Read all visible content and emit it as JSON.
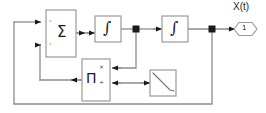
{
  "diagram": {
    "type": "block-diagram",
    "canvas": {
      "width": 266,
      "height": 113
    },
    "colors": {
      "block_stroke": "#9a9a9a",
      "block_fill": "#ffffff",
      "signal_line": "#8c8c8c",
      "arrow_fill": "#1a1a1a",
      "junction_fill": "#1a1a1a",
      "text": "#1a1a1a"
    },
    "blocks": [
      {
        "id": "sum",
        "name": "sum-block",
        "label": "Σ",
        "sign_top": "-",
        "sign_bottom": "-",
        "x": 46,
        "y": 10,
        "w": 30,
        "h": 47
      },
      {
        "id": "integrator1",
        "name": "integrator-block-1",
        "label": "∫",
        "x": 95,
        "y": 16,
        "w": 26,
        "h": 26
      },
      {
        "id": "integrator2",
        "name": "integrator-block-2",
        "label": "∫",
        "x": 162,
        "y": 16,
        "w": 26,
        "h": 26
      },
      {
        "id": "product",
        "name": "product-divide-block",
        "label": "Π",
        "op_top": "×",
        "op_bottom": "÷",
        "x": 82,
        "y": 59,
        "w": 28,
        "h": 42
      },
      {
        "id": "ramp",
        "name": "negative-slope-block",
        "label": "",
        "x": 150,
        "y": 70,
        "w": 26,
        "h": 26
      }
    ],
    "ports": [
      {
        "id": "out1",
        "name": "output-port",
        "signal_label": "X(t)",
        "port_number": "1",
        "x": 238,
        "y": 29
      }
    ],
    "junctions": [
      {
        "id": "j1",
        "name": "junction-after-integrator-1",
        "x": 136,
        "y": 29
      },
      {
        "id": "j2",
        "name": "junction-after-integrator-2",
        "x": 212,
        "y": 29
      }
    ],
    "signals": [
      {
        "from": "sum",
        "to": "integrator1",
        "name": "signal-sum-to-integrator-1"
      },
      {
        "from": "integrator1",
        "to": "j1",
        "name": "signal-integrator-1-to-junction-1"
      },
      {
        "from": "j1",
        "to": "integrator2",
        "name": "signal-junction-1-to-integrator-2"
      },
      {
        "from": "integrator2",
        "to": "j2",
        "name": "signal-integrator-2-to-junction-2"
      },
      {
        "from": "j2",
        "to": "out1",
        "name": "signal-junction-2-to-output-port"
      },
      {
        "from": "j1",
        "to": "product",
        "name": "feedback-junction-1-to-product-multiply-input"
      },
      {
        "from": "ramp",
        "to": "product",
        "name": "signal-ramp-to-product-divide-input"
      },
      {
        "from": "product",
        "to": "sum",
        "name": "feedback-product-to-sum-second-input"
      },
      {
        "from": "j2",
        "to": "sum",
        "name": "outer-feedback-junction-2-to-sum-first-input"
      }
    ]
  }
}
